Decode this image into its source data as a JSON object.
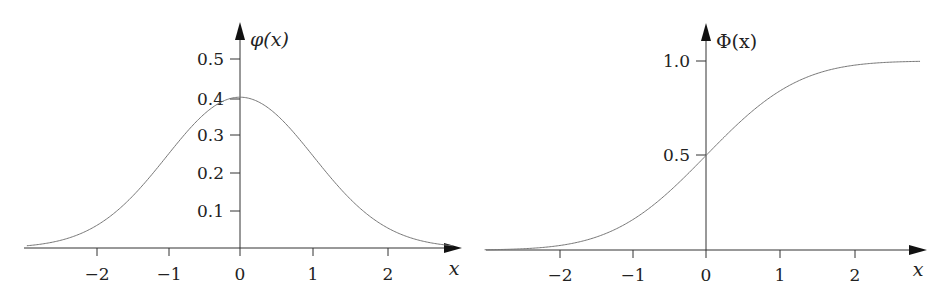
{
  "chart_data": [
    {
      "type": "line",
      "title": "",
      "xlabel": "x",
      "ylabel": "φ(x)",
      "function": "standard normal probability density",
      "xlim": [
        -2.9,
        2.9
      ],
      "ylim": [
        0,
        0.55
      ],
      "x_ticks": [
        "−2",
        "−1",
        "0",
        "1",
        "2"
      ],
      "y_ticks": [
        "0.1",
        "0.2",
        "0.3",
        "0.4",
        "0.5"
      ],
      "grid": false,
      "legend": null,
      "x": [
        -2.9,
        -2.5,
        -2.0,
        -1.5,
        -1.0,
        -0.5,
        0.0,
        0.5,
        1.0,
        1.5,
        2.0,
        2.5,
        2.9
      ],
      "values": [
        0.006,
        0.018,
        0.054,
        0.13,
        0.242,
        0.352,
        0.399,
        0.352,
        0.242,
        0.13,
        0.054,
        0.018,
        0.006
      ]
    },
    {
      "type": "line",
      "title": "",
      "xlabel": "x",
      "ylabel": "Φ(x)",
      "function": "standard normal cumulative distribution",
      "xlim": [
        -3.0,
        2.9
      ],
      "ylim": [
        0,
        1.05
      ],
      "x_ticks": [
        "−2",
        "−1",
        "0",
        "1",
        "2"
      ],
      "y_ticks": [
        "0.5",
        "1.0"
      ],
      "grid": false,
      "legend": null,
      "x": [
        -3.0,
        -2.5,
        -2.0,
        -1.5,
        -1.0,
        -0.5,
        0.0,
        0.5,
        1.0,
        1.5,
        2.0,
        2.5,
        2.9
      ],
      "values": [
        0.001,
        0.006,
        0.023,
        0.067,
        0.159,
        0.309,
        0.5,
        0.691,
        0.841,
        0.933,
        0.977,
        0.994,
        0.998
      ]
    }
  ],
  "left_chart": {
    "ylabel": "φ(x)",
    "xlabel": "x",
    "x_ticks": [
      "−2",
      "−1",
      "0",
      "1",
      "2"
    ],
    "y_ticks": [
      "0.5",
      "0.4",
      "0.3",
      "0.2",
      "0.1"
    ]
  },
  "right_chart": {
    "ylabel": "Φ(x)",
    "xlabel": "x",
    "x_ticks": [
      "−2",
      "−1",
      "0",
      "1",
      "2"
    ],
    "y_ticks": [
      "1.0",
      "0.5"
    ]
  },
  "style": {
    "axis_color": "#333333",
    "curve_color": "#777777"
  }
}
